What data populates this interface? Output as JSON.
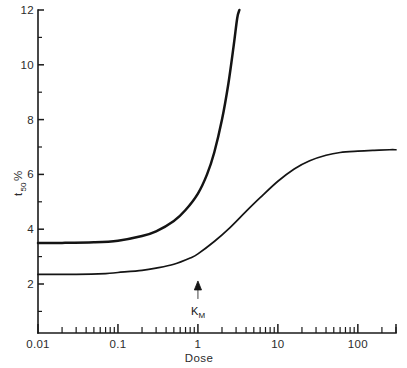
{
  "chart_data": {
    "type": "line",
    "title": "",
    "xlabel": "Dose",
    "ylabel": "t50 %",
    "xscale": "log",
    "yscale": "linear",
    "xlim": [
      0.01,
      300
    ],
    "ylim": [
      0,
      12
    ],
    "grid": false,
    "legend": null,
    "x_tick_labels": [
      "0.01",
      "0.1",
      "1",
      "10",
      "100"
    ],
    "x_tick_values": [
      0.01,
      0.1,
      1,
      10,
      100
    ],
    "y_tick_labels": [
      "12",
      "10",
      "8",
      "6",
      "4",
      "2"
    ],
    "y_tick_values": [
      12,
      10,
      8,
      6,
      4,
      2
    ],
    "y_minor_ticks": [
      11,
      9,
      7,
      5,
      3,
      1
    ],
    "series": [
      {
        "name": "upper-curve",
        "x": [
          0.01,
          0.02,
          0.05,
          0.1,
          0.2,
          0.3,
          0.5,
          0.7,
          1.0,
          1.3,
          1.6,
          2.0,
          2.4,
          2.8,
          3.1,
          3.3
        ],
        "y": [
          3.5,
          3.5,
          3.52,
          3.58,
          3.75,
          3.92,
          4.3,
          4.7,
          5.3,
          6.0,
          6.8,
          8.0,
          9.3,
          10.7,
          11.7,
          12.0
        ]
      },
      {
        "name": "lower-curve",
        "x": [
          0.01,
          0.03,
          0.07,
          0.1,
          0.2,
          0.3,
          0.5,
          0.8,
          1.0,
          1.6,
          2.5,
          4.0,
          6.0,
          10,
          16,
          25,
          40,
          60,
          100,
          160,
          250,
          300
        ],
        "y": [
          2.35,
          2.35,
          2.38,
          2.42,
          2.5,
          2.58,
          2.72,
          2.95,
          3.1,
          3.55,
          4.05,
          4.65,
          5.15,
          5.75,
          6.2,
          6.5,
          6.7,
          6.8,
          6.85,
          6.88,
          6.9,
          6.9
        ]
      }
    ],
    "annotations": [
      {
        "name": "km-arrow",
        "label": "K",
        "sublabel": "M",
        "x_value": 1,
        "y_value": 1.6,
        "arrow_direction": "up"
      }
    ],
    "colors": {
      "curve": "#141414",
      "axis": "#1a1a1a",
      "text": "#2b2b2b",
      "background": "#ffffff"
    }
  },
  "axes": {
    "y_label_main": "t",
    "y_label_sub": "50",
    "y_label_percent": "%",
    "x_title": "Dose"
  }
}
